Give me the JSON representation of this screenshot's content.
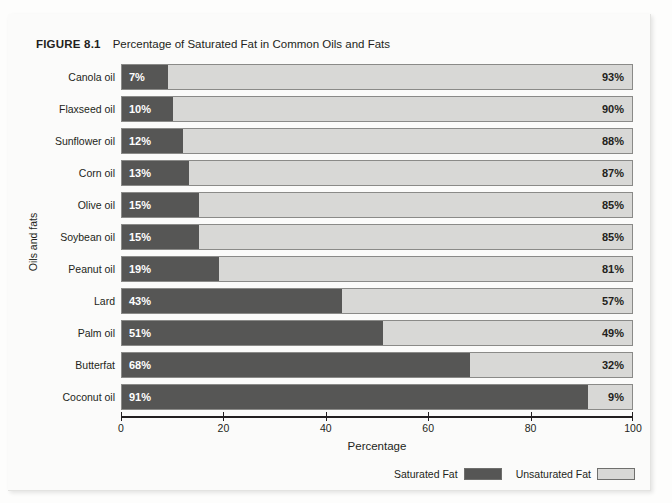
{
  "figure": {
    "number_label": "FIGURE 8.1",
    "title": "Percentage of Saturated Fat in Common Oils and Fats",
    "ghost_top_text": ""
  },
  "legend": {
    "position": "bottom-right",
    "items": [
      {
        "label": "Saturated Fat",
        "color": "#565655",
        "name": "saturated-fat"
      },
      {
        "label": "Unsaturated Fat",
        "color": "#d8d8d6",
        "name": "unsaturated-fat"
      }
    ]
  },
  "colors": {
    "saturated": "#565655",
    "unsaturated": "#d8d8d6",
    "bar_border": "#8a8a88",
    "text": "#231f20",
    "plate": "#fbfbfa"
  },
  "chart_data": {
    "type": "bar",
    "orientation": "horizontal",
    "stacked": true,
    "stacked_percent": true,
    "title": "Percentage of Saturated Fat in Common Oils and Fats",
    "xlabel": "Percentage",
    "ylabel": "Oils and fats",
    "xlim": [
      0,
      100
    ],
    "xticks": [
      0,
      20,
      40,
      60,
      80,
      100
    ],
    "xticklabels": [
      "0",
      "20",
      "40",
      "60",
      "80",
      "100"
    ],
    "grid": false,
    "legend_position": "bottom-right",
    "categories": [
      "Canola oil",
      "Flaxseed oil",
      "Sunflower oil",
      "Corn oil",
      "Olive oil",
      "Soybean oil",
      "Peanut oil",
      "Lard",
      "Palm oil",
      "Butterfat",
      "Coconut oil"
    ],
    "series": [
      {
        "name": "Saturated Fat",
        "color": "#565655",
        "values": [
          7,
          10,
          12,
          13,
          15,
          15,
          19,
          43,
          51,
          68,
          91
        ],
        "value_labels": [
          "7%",
          "10%",
          "12%",
          "13%",
          "15%",
          "15%",
          "19%",
          "43%",
          "51%",
          "68%",
          "91%"
        ]
      },
      {
        "name": "Unsaturated Fat",
        "color": "#d8d8d6",
        "values": [
          93,
          90,
          88,
          87,
          85,
          85,
          81,
          57,
          49,
          32,
          9
        ],
        "value_labels": [
          "93%",
          "90%",
          "88%",
          "87%",
          "85%",
          "85%",
          "81%",
          "57%",
          "49%",
          "32%",
          "9%"
        ]
      }
    ],
    "rows": [
      {
        "category": "Canola oil",
        "saturated": 7,
        "unsaturated": 93,
        "saturated_label": "7%",
        "unsaturated_label": "93%"
      },
      {
        "category": "Flaxseed oil",
        "saturated": 10,
        "unsaturated": 90,
        "saturated_label": "10%",
        "unsaturated_label": "90%"
      },
      {
        "category": "Sunflower oil",
        "saturated": 12,
        "unsaturated": 88,
        "saturated_label": "12%",
        "unsaturated_label": "88%"
      },
      {
        "category": "Corn oil",
        "saturated": 13,
        "unsaturated": 87,
        "saturated_label": "13%",
        "unsaturated_label": "87%"
      },
      {
        "category": "Olive oil",
        "saturated": 15,
        "unsaturated": 85,
        "saturated_label": "15%",
        "unsaturated_label": "85%"
      },
      {
        "category": "Soybean oil",
        "saturated": 15,
        "unsaturated": 85,
        "saturated_label": "15%",
        "unsaturated_label": "85%"
      },
      {
        "category": "Peanut oil",
        "saturated": 19,
        "unsaturated": 81,
        "saturated_label": "19%",
        "unsaturated_label": "81%"
      },
      {
        "category": "Lard",
        "saturated": 43,
        "unsaturated": 57,
        "saturated_label": "43%",
        "unsaturated_label": "57%"
      },
      {
        "category": "Palm oil",
        "saturated": 51,
        "unsaturated": 49,
        "saturated_label": "51%",
        "unsaturated_label": "49%"
      },
      {
        "category": "Butterfat",
        "saturated": 68,
        "unsaturated": 32,
        "saturated_label": "68%",
        "unsaturated_label": "32%"
      },
      {
        "category": "Coconut oil",
        "saturated": 91,
        "unsaturated": 9,
        "saturated_label": "91%",
        "unsaturated_label": "9%"
      }
    ]
  }
}
